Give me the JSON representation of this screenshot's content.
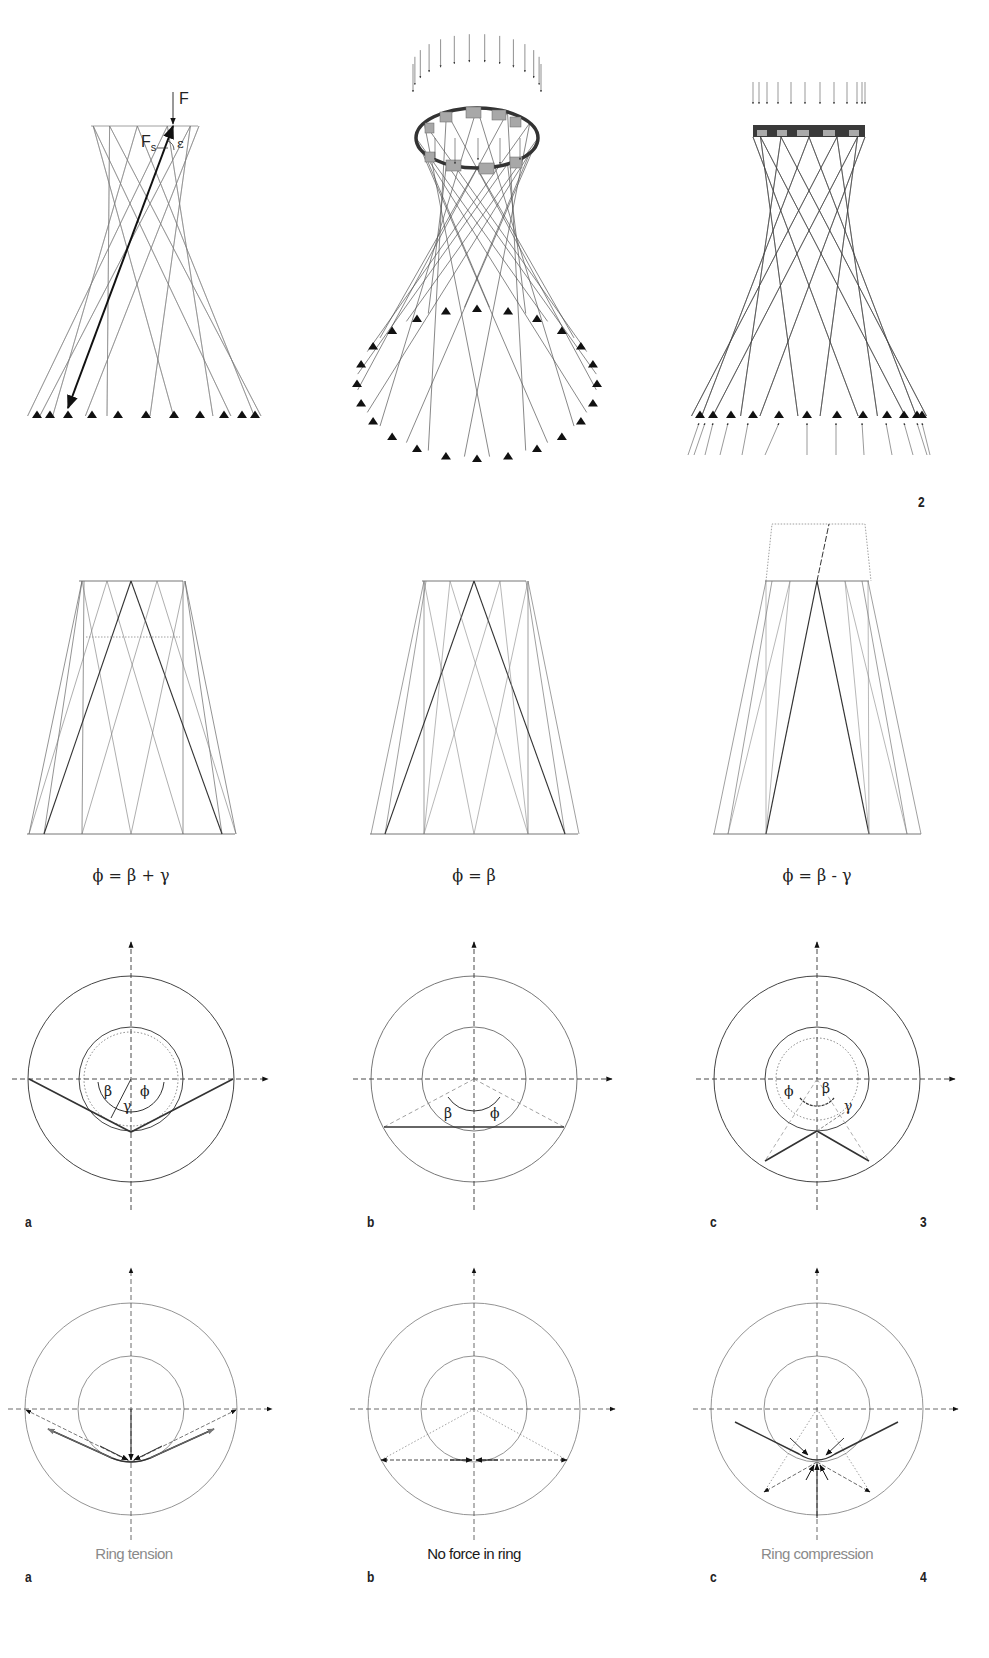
{
  "figure2": {
    "number": "2",
    "panels": [
      {
        "id": "2a",
        "description": "Hyperboloid lattice tower, elevation with force F and member force Fs",
        "labels": {
          "force": "F",
          "member_force": "F",
          "member_force_sub": "s",
          "angle": "ε"
        },
        "supports": 11
      },
      {
        "id": "2b",
        "description": "Perspective view of hyperboloid with top ring and distributed load arrows",
        "supports": 24
      },
      {
        "id": "2c",
        "description": "Elevation with top ring beam, load arrows and support reactions",
        "supports": 12
      }
    ]
  },
  "figure3": {
    "number": "3",
    "panels": [
      {
        "id": "a",
        "label": "a",
        "formula": "ϕ = β + γ",
        "angles": {
          "beta": "β",
          "gamma": "γ",
          "phi": "ϕ"
        }
      },
      {
        "id": "b",
        "label": "b",
        "formula": "ϕ = β",
        "angles": {
          "beta": "β",
          "phi": "ϕ"
        }
      },
      {
        "id": "c",
        "label": "c",
        "formula": "ϕ = β - γ",
        "angles": {
          "beta": "β",
          "gamma": "γ",
          "phi": "ϕ"
        }
      }
    ]
  },
  "figure4": {
    "number": "4",
    "panels": [
      {
        "id": "a",
        "label": "a",
        "caption": "Ring tension",
        "caption_color": "#8a8a8a"
      },
      {
        "id": "b",
        "label": "b",
        "caption": "No force in ring",
        "caption_color": "#1a1a1a"
      },
      {
        "id": "c",
        "label": "c",
        "caption": "Ring compression",
        "caption_color": "#8a8a8a"
      }
    ]
  },
  "colors": {
    "line": "#555555",
    "line_heavy": "#222222",
    "line_light": "#9a9a9a",
    "ring_fill": "#a8a8a8",
    "background": "#ffffff"
  }
}
